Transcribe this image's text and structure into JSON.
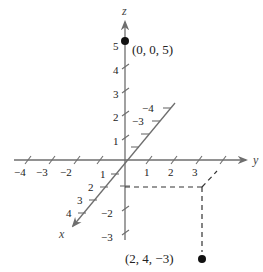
{
  "figure": {
    "origin_px": [
      125,
      160
    ],
    "axes": {
      "x": {
        "label": "x",
        "tick_labels": [
          "1",
          "2",
          "3",
          "4"
        ],
        "negative_tick_labels": [
          "-3",
          "-4"
        ]
      },
      "y": {
        "label": "y",
        "tick_labels": [
          "-4",
          "-3",
          "-2",
          "1",
          "2",
          "3"
        ]
      },
      "z": {
        "label": "z",
        "tick_labels": [
          "5",
          "4",
          "3",
          "2",
          "1",
          "-2",
          "-3"
        ]
      }
    },
    "points": [
      {
        "label": "(0, 0, 5)",
        "coords": [
          0,
          0,
          5
        ]
      },
      {
        "label": "(2, 4, −3)",
        "coords": [
          2,
          4,
          -3
        ]
      }
    ],
    "colors": {
      "axis": "#6e6e6e",
      "point": "#111111",
      "dash": "#333333"
    }
  },
  "labels": {
    "x_axis": "x",
    "y_axis": "y",
    "z_axis": "z",
    "y_ticks": {
      "n4": "−4",
      "n3": "−3",
      "n2": "−2",
      "p1": "1",
      "p2": "2",
      "p3": "3"
    },
    "z_ticks": {
      "p5": "5",
      "p4": "4",
      "p3": "3",
      "p2": "2",
      "p1": "1",
      "n2": "−2",
      "n3": "−3"
    },
    "x_ticks": {
      "p1": "1",
      "p2": "2",
      "p3": "3",
      "p4": "4",
      "n3": "−3",
      "n4": "−4"
    },
    "point_a": "(0, 0, 5)",
    "point_b": "(2, 4, −3)"
  }
}
